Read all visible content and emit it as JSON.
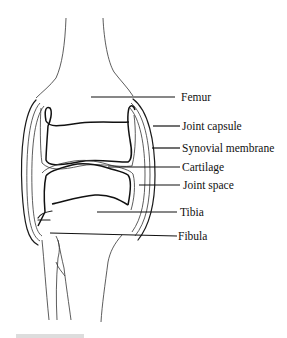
{
  "diagram": {
    "labels": [
      {
        "id": "femur",
        "text": "Femur"
      },
      {
        "id": "joint-capsule",
        "text": "Joint capsule"
      },
      {
        "id": "synovial-membrane",
        "text": "Synovial membrane"
      },
      {
        "id": "cartilage",
        "text": "Cartilage"
      },
      {
        "id": "joint-space",
        "text": "Joint space"
      },
      {
        "id": "tibia",
        "text": "Tibia"
      },
      {
        "id": "fibula",
        "text": "Fibula"
      }
    ]
  }
}
